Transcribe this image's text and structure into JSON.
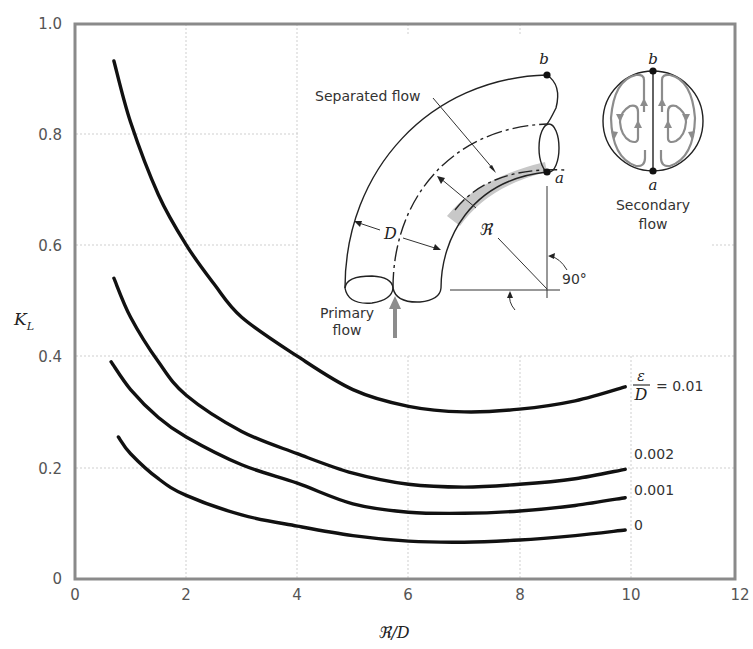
{
  "chart_data": {
    "type": "line",
    "title": "",
    "xlabel": "ℜ/D",
    "ylabel": "K_L",
    "xlim": [
      0,
      12
    ],
    "ylim": [
      0,
      1.0
    ],
    "grid": true,
    "x_ticks": [
      "0",
      "2",
      "4",
      "6",
      "8",
      "10",
      "12"
    ],
    "y_ticks": [
      "0",
      "0.2",
      "0.4",
      "0.6",
      "0.8",
      "1.0"
    ],
    "legend_position": "right, labels at curve ends",
    "series": [
      {
        "name": "ε/D = 0.01",
        "label": "= 0.01",
        "x": [
          0.7,
          1.0,
          1.5,
          2.0,
          2.5,
          3.0,
          4.0,
          5.0,
          6.0,
          7.0,
          8.0,
          9.0,
          9.9
        ],
        "values": [
          0.93,
          0.82,
          0.69,
          0.6,
          0.53,
          0.47,
          0.4,
          0.34,
          0.31,
          0.3,
          0.305,
          0.32,
          0.345
        ]
      },
      {
        "name": "ε/D = 0.002",
        "label": "0.002",
        "x": [
          0.7,
          1.0,
          1.5,
          2.0,
          3.0,
          4.0,
          5.0,
          6.0,
          7.0,
          8.0,
          9.0,
          9.9
        ],
        "values": [
          0.54,
          0.47,
          0.39,
          0.33,
          0.265,
          0.225,
          0.19,
          0.17,
          0.165,
          0.17,
          0.18,
          0.197
        ]
      },
      {
        "name": "ε/D = 0.001",
        "label": "0.001",
        "x": [
          0.65,
          1.0,
          1.5,
          2.0,
          3.0,
          4.0,
          5.0,
          6.0,
          7.0,
          8.0,
          9.0,
          9.9
        ],
        "values": [
          0.39,
          0.34,
          0.29,
          0.255,
          0.205,
          0.172,
          0.135,
          0.12,
          0.118,
          0.122,
          0.132,
          0.146
        ]
      },
      {
        "name": "ε/D = 0",
        "label": "0",
        "x": [
          0.78,
          1.0,
          1.5,
          2.0,
          3.0,
          4.0,
          5.0,
          6.0,
          7.0,
          8.0,
          9.0,
          9.9
        ],
        "values": [
          0.255,
          0.225,
          0.18,
          0.15,
          0.115,
          0.095,
          0.078,
          0.068,
          0.066,
          0.07,
          0.078,
          0.088
        ]
      }
    ],
    "legend_prefix": {
      "numerator": "ε",
      "denominator": "D"
    },
    "annotations": {
      "inset_bend": {
        "separated_flow": "Separated flow",
        "primary_flow_line1": "Primary",
        "primary_flow_line2": "flow",
        "diameter": "D",
        "radius": "ℜ",
        "angle": "90°",
        "point_a": "a",
        "point_b": "b"
      },
      "inset_secondary": {
        "label_line1": "Secondary",
        "label_line2": "flow",
        "point_a": "a",
        "point_b": "b"
      }
    }
  },
  "colors": {
    "curve": "#111111",
    "grid": "#cfcfcf",
    "frame": "#8a8a8a",
    "separated_region": "#c8c8c8",
    "secondary_streamlines": "#8c8c8c"
  }
}
